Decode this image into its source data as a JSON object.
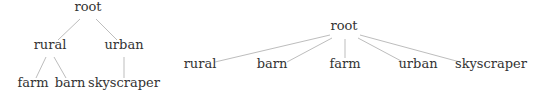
{
  "diagrams": [
    {
      "name": "hierarchical-tree",
      "root": "root",
      "nodes": [
        {
          "id": "root",
          "label": "root",
          "x": 88,
          "y": 15
        },
        {
          "id": "rural",
          "label": "rural",
          "x": 50,
          "y": 53
        },
        {
          "id": "urban",
          "label": "urban",
          "x": 124,
          "y": 53
        },
        {
          "id": "farm",
          "label": "farm",
          "x": 33,
          "y": 91
        },
        {
          "id": "barn",
          "label": "barn",
          "x": 70,
          "y": 91
        },
        {
          "id": "skyscraper",
          "label": "skyscraper",
          "x": 124,
          "y": 91
        }
      ],
      "edges": [
        {
          "from": "root",
          "to": "rural",
          "x1": 80,
          "y1": 19,
          "x2": 58,
          "y2": 40
        },
        {
          "from": "root",
          "to": "urban",
          "x1": 96,
          "y1": 19,
          "x2": 117,
          "y2": 40
        },
        {
          "from": "rural",
          "to": "farm",
          "x1": 46,
          "y1": 57,
          "x2": 36,
          "y2": 78
        },
        {
          "from": "rural",
          "to": "barn",
          "x1": 54,
          "y1": 57,
          "x2": 66,
          "y2": 78
        },
        {
          "from": "urban",
          "to": "skyscraper",
          "x1": 124,
          "y1": 57,
          "x2": 124,
          "y2": 78
        }
      ]
    },
    {
      "name": "flat-tree",
      "root": "root",
      "nodes": [
        {
          "id": "root",
          "label": "root",
          "x": 344,
          "y": 34
        },
        {
          "id": "rural",
          "label": "rural",
          "x": 200,
          "y": 72
        },
        {
          "id": "barn",
          "label": "barn",
          "x": 272,
          "y": 72
        },
        {
          "id": "farm",
          "label": "farm",
          "x": 345,
          "y": 72
        },
        {
          "id": "urban",
          "label": "urban",
          "x": 418,
          "y": 72
        },
        {
          "id": "skyscraper",
          "label": "skyscraper",
          "x": 491,
          "y": 72
        }
      ],
      "edges": [
        {
          "from": "root",
          "to": "rural",
          "x1": 330,
          "y1": 35,
          "x2": 215,
          "y2": 62
        },
        {
          "from": "root",
          "to": "barn",
          "x1": 332,
          "y1": 38,
          "x2": 287,
          "y2": 62
        },
        {
          "from": "root",
          "to": "farm",
          "x1": 345,
          "y1": 39,
          "x2": 345,
          "y2": 58
        },
        {
          "from": "root",
          "to": "urban",
          "x1": 358,
          "y1": 38,
          "x2": 403,
          "y2": 62
        },
        {
          "from": "root",
          "to": "skyscraper",
          "x1": 360,
          "y1": 35,
          "x2": 460,
          "y2": 62
        }
      ]
    }
  ]
}
